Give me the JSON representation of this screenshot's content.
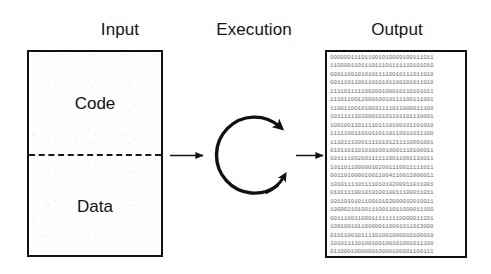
{
  "figure": {
    "background_color": "#ffffff",
    "ink_color": "#111111"
  },
  "columns": {
    "input_label": "Input",
    "execution_label": "Execution",
    "output_label": "Output"
  },
  "input_box": {
    "code_label": "Code",
    "data_label": "Data",
    "divider_style": "dashed",
    "border_color": "#111111",
    "fill_color": "#fefefe"
  },
  "execution": {
    "symbol": "cyclic-loop-arrow",
    "description": "clockwise circular arrow with two arrowheads",
    "stroke_color": "#111111"
  },
  "arrows": {
    "input_to_execution": "arrow-right",
    "execution_to_output": "arrow-right"
  },
  "output_box": {
    "content_type": "binary",
    "border_color": "#111111",
    "text_color": "#6d6d6d",
    "lines": [
      "000000111011001010009100111011",
      "110000110111011101111110101010",
      "000110010101011110010111011010",
      "001110110011010101100101011010",
      "111101111100200100010110101011",
      "111011001200010010111100111001",
      "110011001010031111011000011100",
      "101111110200010101101101110001",
      "100100110111101110100101101010",
      "111110011010110110110011011100",
      "111011100011110101211110001001",
      "010110110101010010001110100011",
      "001111002001111110011001110011",
      "101101100000102001110011111011",
      "001101000010011004110011000011",
      "101011110111101010200011011001",
      "010111100101010010011100011011",
      "101101010110010102000010010011",
      "100002101001110011011000011100",
      "001110011000111111110000011201",
      "100100101100000110001011013000",
      "010110010111101001000010100010",
      "101011110100100100101001011100",
      "011000100000010000100001100111"
    ]
  }
}
